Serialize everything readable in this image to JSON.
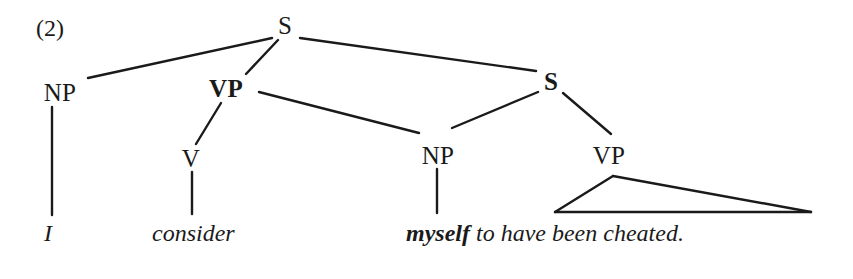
{
  "figure": {
    "example_label": "(2)",
    "label_x": 36,
    "label_y": 28,
    "background": "#ffffff",
    "ink_color": "#1a1a1a"
  },
  "tree": {
    "nodes": [
      {
        "id": "s-top",
        "text": "S",
        "x": 285,
        "y": 25,
        "style": "cat",
        "bold": false
      },
      {
        "id": "np-subj",
        "text": "NP",
        "x": 60,
        "y": 92,
        "style": "cat",
        "bold": false
      },
      {
        "id": "vp-main",
        "text": "VP",
        "x": 226,
        "y": 88,
        "style": "cat",
        "bold": true
      },
      {
        "id": "s-embed",
        "text": "S",
        "x": 551,
        "y": 81,
        "style": "cat",
        "bold": true
      },
      {
        "id": "v-head",
        "text": "V",
        "x": 191,
        "y": 158,
        "style": "cat",
        "bold": false
      },
      {
        "id": "np-obj",
        "text": "NP",
        "x": 438,
        "y": 155,
        "style": "cat",
        "bold": false
      },
      {
        "id": "vp-emb",
        "text": "VP",
        "x": 609,
        "y": 155,
        "style": "cat",
        "bold": false
      }
    ],
    "edges": [
      {
        "id": "s-to-np-subj",
        "from": "s-top",
        "to": "np-subj",
        "x1": 272,
        "y1": 38,
        "x2": 88,
        "y2": 78
      },
      {
        "id": "s-to-vp-main",
        "from": "s-top",
        "to": "vp-main",
        "x1": 278,
        "y1": 40,
        "x2": 246,
        "y2": 74
      },
      {
        "id": "s-to-s-embed",
        "from": "s-top",
        "to": "s-embed",
        "x1": 300,
        "y1": 38,
        "x2": 536,
        "y2": 71
      },
      {
        "id": "vp-to-v",
        "from": "vp-main",
        "to": "v-head",
        "x1": 221,
        "y1": 103,
        "x2": 196,
        "y2": 144
      },
      {
        "id": "vp-to-np-obj",
        "from": "vp-main",
        "to": "np-obj",
        "x1": 259,
        "y1": 92,
        "x2": 419,
        "y2": 133
      },
      {
        "id": "s-emb-to-np",
        "from": "s-embed",
        "to": "np-obj",
        "x1": 538,
        "y1": 92,
        "x2": 452,
        "y2": 128
      },
      {
        "id": "s-emb-to-vp",
        "from": "s-embed",
        "to": "vp-emb",
        "x1": 563,
        "y1": 93,
        "x2": 611,
        "y2": 134
      },
      {
        "id": "np-subj-to-i",
        "from": "np-subj",
        "to": "term-i",
        "x1": 52,
        "y1": 107,
        "x2": 52,
        "y2": 215
      },
      {
        "id": "v-to-consider",
        "from": "v-head",
        "to": "term-v",
        "x1": 192,
        "y1": 172,
        "x2": 192,
        "y2": 214
      },
      {
        "id": "np-obj-to-my",
        "from": "np-obj",
        "to": "term-np",
        "x1": 437,
        "y1": 169,
        "x2": 437,
        "y2": 213
      }
    ],
    "triangle": {
      "id": "vp-triangle",
      "apex_x": 613,
      "apex_y": 176,
      "left_x": 555,
      "left_y": 212,
      "right_x": 811,
      "right_y": 212
    },
    "terminals": [
      {
        "id": "term-i",
        "text": "I",
        "x": 44,
        "y": 233,
        "emphasis": "italic"
      },
      {
        "id": "term-v",
        "text": "consider",
        "x": 152,
        "y": 233,
        "emphasis": "italic"
      }
    ],
    "terminal_run": {
      "id": "term-clause",
      "x": 406,
      "y": 233,
      "bold_part": "myself",
      "space": " ",
      "plain_part": "to have been cheated."
    }
  }
}
